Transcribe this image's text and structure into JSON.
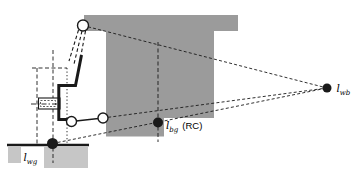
{
  "figure": {
    "labels": {
      "wb": {
        "symbol": "l",
        "sub": "wb"
      },
      "bg": {
        "symbol": "l",
        "sub": "bg",
        "suffix": "(RC)"
      },
      "wg": {
        "symbol": "l",
        "sub": "wg"
      }
    },
    "colors": {
      "body_gray": "#9b9b9b",
      "ground_gray": "#c6c6c6",
      "line": "#1a1a1a",
      "background": "#ffffff"
    }
  }
}
